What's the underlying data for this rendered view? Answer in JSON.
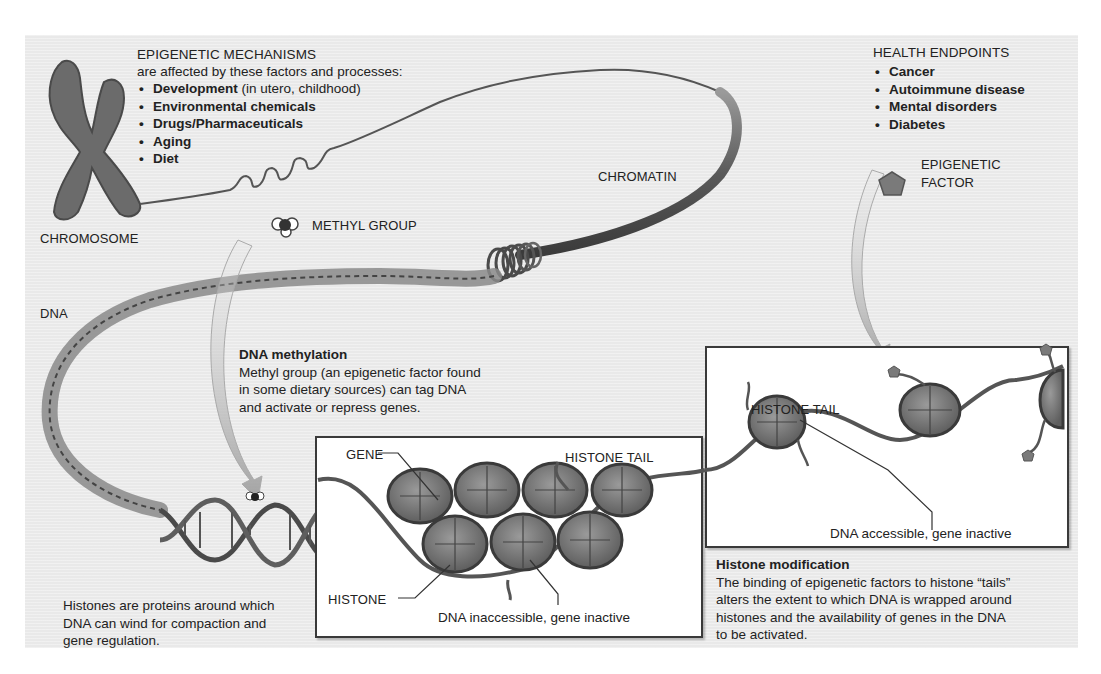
{
  "figure": {
    "theme": "Epigenetic mechanisms",
    "colors": {
      "background_panel": "#e9e9e9",
      "page": "#ffffff",
      "text": "#222222",
      "histone": "#6e6e6e",
      "strand": "#555555",
      "box_border": "#3a3a3a"
    }
  },
  "mechanisms": {
    "title": "EPIGENETIC MECHANISMS",
    "subtitle": "are affected by these factors and processes:",
    "items": [
      {
        "bold": "Development",
        "rest": " (in utero, childhood)"
      },
      {
        "bold": "Environmental chemicals",
        "rest": ""
      },
      {
        "bold": "Drugs/Pharmaceuticals",
        "rest": ""
      },
      {
        "bold": "Aging",
        "rest": ""
      },
      {
        "bold": "Diet",
        "rest": ""
      }
    ]
  },
  "health": {
    "title": "HEALTH ENDPOINTS",
    "items": [
      "Cancer",
      "Autoimmune disease",
      "Mental disorders",
      "Diabetes"
    ]
  },
  "labels": {
    "chromosome": "CHROMOSOME",
    "chromatin": "CHROMATIN",
    "methyl_group": "METHYL GROUP",
    "dna": "DNA",
    "epigenetic_factor_line1": "EPIGENETIC",
    "epigenetic_factor_line2": "FACTOR",
    "gene": "GENE",
    "histone_tail_left": "HISTONE TAIL",
    "histone": "HISTONE",
    "dna_inaccessible": "DNA inaccessible, gene inactive",
    "histone_tail_right": "HISTONE TAIL",
    "dna_accessible": "DNA accessible, gene inactive"
  },
  "methylation": {
    "heading": "DNA methylation",
    "lines": [
      "Methyl group (an epigenetic factor found",
      "in some dietary sources) can tag DNA",
      "and activate or repress genes."
    ]
  },
  "histones_note": {
    "lines": [
      "Histones are proteins around which",
      "DNA can wind for compaction and",
      "gene regulation."
    ]
  },
  "histone_modification": {
    "heading": "Histone modification",
    "lines": [
      "The binding of epigenetic factors to histone “tails”",
      "alters the extent to which DNA is wrapped around",
      "histones and the availability of genes in the DNA",
      "to be activated."
    ]
  }
}
